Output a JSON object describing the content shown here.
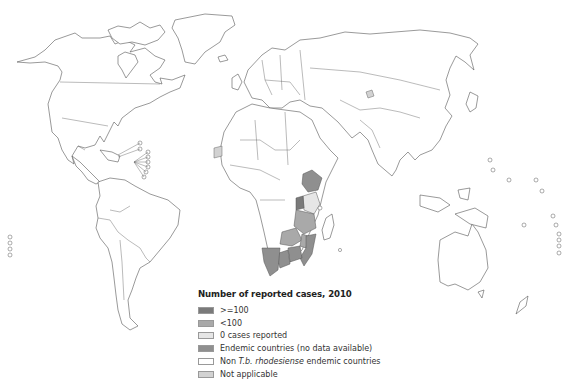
{
  "map": {
    "title": "Number of reported cases, 2010",
    "disease": "T.b. rhodesiense human African trypanosomiasis",
    "colors": {
      "ge100": "#7a7a7a",
      "lt100": "#a9a9a9",
      "zero": "#e6e6e6",
      "endemic_no_data": "#8f8f8f",
      "non_endemic": "#ffffff",
      "not_applicable": "#d2d2d2",
      "outline": "#555555"
    },
    "shaded_regions": [
      {
        "region": "Ethiopia",
        "category": "endemic_no_data"
      },
      {
        "region": "Kenya",
        "category": "zero"
      },
      {
        "region": "Uganda",
        "category": "ge100"
      },
      {
        "region": "Tanzania",
        "category": "lt100"
      },
      {
        "region": "Malawi",
        "category": "lt100"
      },
      {
        "region": "Zambia",
        "category": "lt100"
      },
      {
        "region": "Zimbabwe",
        "category": "endemic_no_data"
      },
      {
        "region": "Mozambique",
        "category": "endemic_no_data"
      },
      {
        "region": "Botswana",
        "category": "endemic_no_data"
      },
      {
        "region": "Namibia",
        "category": "endemic_no_data"
      },
      {
        "region": "Western Sahara",
        "category": "not_applicable"
      },
      {
        "region": "Kashmir",
        "category": "not_applicable"
      }
    ]
  },
  "legend": {
    "title": "Number of reported cases, 2010",
    "items": [
      {
        "key": "ge100",
        "label": ">=100",
        "color": "#7a7a7a"
      },
      {
        "key": "lt100",
        "label": "<100",
        "color": "#a9a9a9"
      },
      {
        "key": "zero",
        "label": "0 cases reported",
        "color": "#e6e6e6"
      },
      {
        "key": "endemic_no_data",
        "label": "Endemic countries (no data available)",
        "color": "#8f8f8f"
      },
      {
        "key": "non_endemic",
        "label_prefix": "Non ",
        "label_italic": "T.b. rhodesiense",
        "label_suffix": " endemic countries",
        "color": "#ffffff"
      },
      {
        "key": "not_applicable",
        "label": "Not applicable",
        "color": "#d2d2d2"
      }
    ]
  }
}
